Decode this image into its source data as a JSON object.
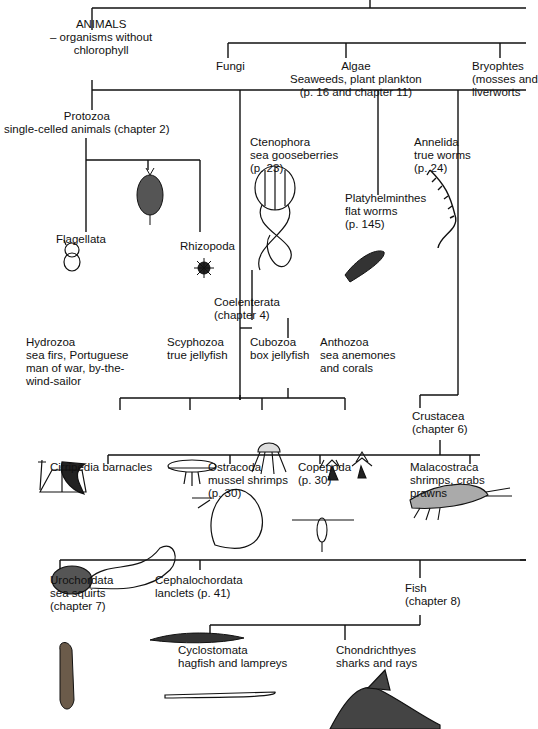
{
  "diagram": {
    "type": "taxonomy-tree",
    "line_color": "#111111",
    "background": "#ffffff"
  },
  "nodes": {
    "animals": {
      "title": "ANIMALS",
      "subtitle": "– organisms without",
      "subtitle2": "chlorophyll"
    },
    "fungi": {
      "title": "Fungi"
    },
    "algae": {
      "title": "Algae",
      "line2": "Seaweeds, plant plankton",
      "line3": "(p. 16 and chapter 11)"
    },
    "bryophytes": {
      "title": "Bryophtes",
      "line2": "(mosses and",
      "line3": "liverworts"
    },
    "protozoa": {
      "title": "Protozoa",
      "line2": "single-celled animals  (chapter 2)"
    },
    "flagellata": {
      "title": "Flagellata"
    },
    "rhizopoda": {
      "title": "Rhizopoda"
    },
    "ctenophora": {
      "title": "Ctenophora",
      "line2": "sea gooseberries",
      "line3": "(p. 23)"
    },
    "platyhelminthes": {
      "title": "Platyhelminthes",
      "line2": "flat worms",
      "line3": "(p. 145)"
    },
    "annelida": {
      "title": "Annelida",
      "line2": "true worms",
      "line3": "(p. 24)"
    },
    "coelenterata": {
      "title": "Coelenterata",
      "line2": "(chapter 4)"
    },
    "hydrozoa": {
      "title": "Hydrozoa",
      "line2": "sea firs, Portuguese",
      "line3": "man of war, by-the-",
      "line4": "wind-sailor"
    },
    "scyphozoa": {
      "title": "Scyphozoa",
      "line2": "true jellyfish"
    },
    "cubozoa": {
      "title": "Cubozoa",
      "line2": "box jellyfish"
    },
    "anthozoa": {
      "title": "Anthozoa",
      "line2": "sea anemones",
      "line3": "and corals"
    },
    "crustacea": {
      "title": "Crustacea",
      "line2": "(chapter 6)"
    },
    "cirripedia": {
      "title": "Cirripedia  barnacles"
    },
    "ostracoda": {
      "title": "Ostracoda",
      "line2": "mussel shrimps",
      "line3": "(p. 30)"
    },
    "copepoda": {
      "title": "Copepoda",
      "line2": "(p. 30)"
    },
    "malacostraca": {
      "title": "Malacostraca",
      "line2": "shrimps, crabs",
      "line3": "prawns"
    },
    "urochordata": {
      "title": "Urochordata",
      "line2": "sea squirts",
      "line3": "(chapter 7)"
    },
    "cephalochordata": {
      "title": "Cephalochordata",
      "line2": "lanclets  (p. 41)"
    },
    "fish": {
      "title": "Fish",
      "line2": "(chapter 8)"
    },
    "cyclostomata": {
      "title": "Cyclostomata",
      "line2": "hagfish and lampreys"
    },
    "chondrichthyes": {
      "title": "Chondrichthyes",
      "line2": "sharks and rays"
    }
  },
  "illustrations": [
    "flagellate-cell",
    "spiny-protozoan",
    "rhizopod-radiolarian",
    "comb-jelly",
    "flatworm",
    "polychaete-worm",
    "hydroid-colony",
    "moon-jellyfish",
    "box-jellyfish",
    "sea-anemones",
    "barnacle",
    "ostracod",
    "copepod",
    "shrimp",
    "sea-squirt",
    "lancelet",
    "lamprey",
    "shark"
  ]
}
